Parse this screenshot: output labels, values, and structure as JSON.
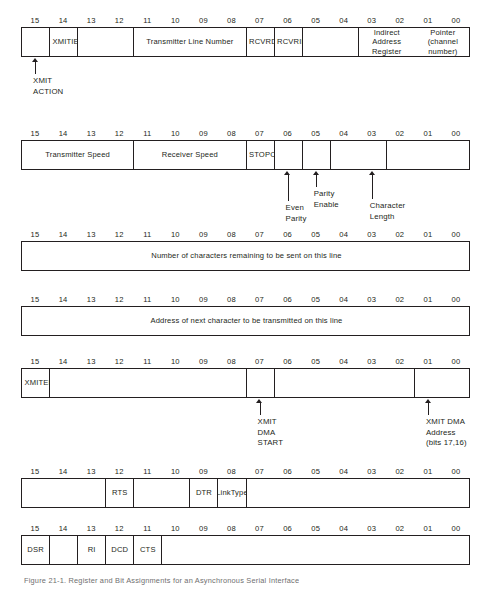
{
  "bit_labels": [
    "15",
    "14",
    "13",
    "12",
    "11",
    "10",
    "09",
    "08",
    "07",
    "06",
    "05",
    "04",
    "03",
    "02",
    "01",
    "00"
  ],
  "caption": "Figure 21-1.  Register and Bit Assignments for an Asynchronous Serial Interface",
  "registers": [
    {
      "name": "register-1",
      "fields": [
        {
          "label": "",
          "start_bit": 15,
          "width_bits": 1,
          "align": "center"
        },
        {
          "label": "XMIT\nIE",
          "start_bit": 14,
          "width_bits": 1,
          "align": "left"
        },
        {
          "label": "",
          "start_bit": 13,
          "width_bits": 2,
          "align": "center"
        },
        {
          "label": "Transmitter  Line Number",
          "start_bit": 11,
          "width_bits": 4,
          "align": "center"
        },
        {
          "label": "RCVR\nDONE",
          "start_bit": 7,
          "width_bits": 1,
          "align": "left"
        },
        {
          "label": "RCVR\nIE",
          "start_bit": 6,
          "width_bits": 1,
          "align": "left"
        },
        {
          "label": "",
          "start_bit": 5,
          "width_bits": 2,
          "align": "center"
        },
        {
          "label": "Indirect Address Register\nPointer (channel number)",
          "start_bit": 3,
          "width_bits": 4,
          "align": "center"
        }
      ],
      "annotations": [
        {
          "label": "XMIT\nACTION",
          "target_bit": 15
        }
      ]
    },
    {
      "name": "register-2",
      "fields": [
        {
          "label": "Transmitter Speed",
          "start_bit": 15,
          "width_bits": 4,
          "align": "center"
        },
        {
          "label": "Receiver Speed",
          "start_bit": 11,
          "width_bits": 4,
          "align": "center"
        },
        {
          "label": "STOP\nCode",
          "start_bit": 7,
          "width_bits": 1,
          "align": "left"
        },
        {
          "label": "",
          "start_bit": 6,
          "width_bits": 1,
          "align": "center"
        },
        {
          "label": "",
          "start_bit": 5,
          "width_bits": 1,
          "align": "center"
        },
        {
          "label": "",
          "start_bit": 4,
          "width_bits": 2,
          "align": "center"
        },
        {
          "label": "",
          "start_bit": 2,
          "width_bits": 3,
          "align": "center"
        }
      ],
      "annotations": [
        {
          "label": "Even\nParity",
          "target_bit": 6
        },
        {
          "label": "Parity\nEnable",
          "target_bit": 5
        },
        {
          "label": "Character\nLength",
          "target_bit": 3
        }
      ]
    },
    {
      "name": "register-3",
      "fields": [
        {
          "label": "Number of characters remaining to be sent on this line",
          "start_bit": 15,
          "width_bits": 16,
          "align": "center"
        }
      ],
      "annotations": []
    },
    {
      "name": "register-4",
      "fields": [
        {
          "label": "Address of next character to be transmitted on this line",
          "start_bit": 15,
          "width_bits": 16,
          "align": "center"
        }
      ],
      "annotations": []
    },
    {
      "name": "register-5",
      "fields": [
        {
          "label": "XMIT\nENAB",
          "start_bit": 15,
          "width_bits": 1,
          "align": "left"
        },
        {
          "label": "",
          "start_bit": 14,
          "width_bits": 7,
          "align": "center"
        },
        {
          "label": "",
          "start_bit": 7,
          "width_bits": 1,
          "align": "center"
        },
        {
          "label": "",
          "start_bit": 6,
          "width_bits": 5,
          "align": "center"
        },
        {
          "label": "",
          "start_bit": 1,
          "width_bits": 2,
          "align": "center"
        }
      ],
      "annotations": [
        {
          "label": "XMIT\nDMA\nSTART",
          "target_bit": 7
        },
        {
          "label": "XMIT DMA\nAddress\n(bits 17,16)",
          "target_bit": 1
        }
      ]
    },
    {
      "name": "register-6",
      "fields": [
        {
          "label": "",
          "start_bit": 15,
          "width_bits": 3,
          "align": "center"
        },
        {
          "label": "RTS",
          "start_bit": 12,
          "width_bits": 1,
          "align": "center"
        },
        {
          "label": "",
          "start_bit": 11,
          "width_bits": 2,
          "align": "center"
        },
        {
          "label": "DTR",
          "start_bit": 9,
          "width_bits": 1,
          "align": "center"
        },
        {
          "label": "Link\nType",
          "start_bit": 8,
          "width_bits": 1,
          "align": "center"
        },
        {
          "label": "",
          "start_bit": 7,
          "width_bits": 8,
          "align": "center"
        }
      ],
      "annotations": []
    },
    {
      "name": "register-7",
      "fields": [
        {
          "label": "DSR",
          "start_bit": 15,
          "width_bits": 1,
          "align": "center"
        },
        {
          "label": "",
          "start_bit": 14,
          "width_bits": 1,
          "align": "center"
        },
        {
          "label": "RI",
          "start_bit": 13,
          "width_bits": 1,
          "align": "center"
        },
        {
          "label": "DCD",
          "start_bit": 12,
          "width_bits": 1,
          "align": "center"
        },
        {
          "label": "CTS",
          "start_bit": 11,
          "width_bits": 1,
          "align": "center"
        },
        {
          "label": "",
          "start_bit": 10,
          "width_bits": 11,
          "align": "center"
        }
      ],
      "annotations": []
    }
  ],
  "layout": {
    "reg_tops": [
      14,
      127,
      228,
      293,
      355,
      465,
      522
    ],
    "ann_stem_lens": [
      [
        14
      ]
    ],
    "annotation_blocks": [
      {
        "reg": 0,
        "stem_h": 12,
        "text_dy": 16
      },
      {
        "reg": 1,
        "stem_h": 26,
        "text_dy": 0
      },
      {
        "reg": 4,
        "stem_h": 12,
        "text_dy": 16
      }
    ]
  },
  "colors": {
    "ink": "#231f20",
    "paper": "#ffffff",
    "caption": "#6f6f6f"
  }
}
